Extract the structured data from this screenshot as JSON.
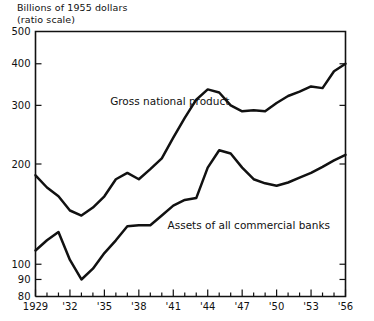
{
  "chart_data": {
    "type": "line",
    "title": "Billions of 1955 dollars",
    "subtitle": "(ratio scale)",
    "ylabel": "Billions of 1955 dollars (ratio scale)",
    "xlabel": "",
    "scale": "log",
    "grid": false,
    "legend_position": "inline-annotation",
    "ylim": [
      80,
      500
    ],
    "xlim": [
      1929,
      1956
    ],
    "ytick_labels": [
      "500",
      "400",
      "300",
      "200",
      "100",
      "90",
      "80"
    ],
    "ytick_values": [
      500,
      400,
      300,
      200,
      100,
      90,
      80
    ],
    "xtick_labels": [
      "1929",
      "'32",
      "'35",
      "'38",
      "'41",
      "'44",
      "'47",
      "'50",
      "'53",
      "'56"
    ],
    "xtick_values": [
      1929,
      1932,
      1935,
      1938,
      1941,
      1944,
      1947,
      1950,
      1953,
      1956
    ],
    "x": [
      1929,
      1930,
      1931,
      1932,
      1933,
      1934,
      1935,
      1936,
      1937,
      1938,
      1939,
      1940,
      1941,
      1942,
      1943,
      1944,
      1945,
      1946,
      1947,
      1948,
      1949,
      1950,
      1951,
      1952,
      1953,
      1954,
      1955,
      1956
    ],
    "series": [
      {
        "name": "Gross national product",
        "label": "Gross national product",
        "color": "#111111",
        "values": [
          185,
          170,
          160,
          145,
          140,
          148,
          160,
          180,
          188,
          180,
          193,
          208,
          240,
          275,
          312,
          335,
          328,
          300,
          288,
          290,
          288,
          305,
          320,
          330,
          342,
          338,
          380,
          400
        ]
      },
      {
        "name": "Assets of all commercial banks",
        "label": "Assets of all commercial banks",
        "color": "#111111",
        "values": [
          110,
          118,
          125,
          103,
          90,
          97,
          108,
          118,
          130,
          131,
          131,
          140,
          150,
          156,
          158,
          195,
          220,
          215,
          195,
          180,
          175,
          172,
          176,
          182,
          188,
          196,
          205,
          213
        ]
      }
    ],
    "annotations": [
      {
        "text": "Gross national product",
        "x": 1935.5,
        "y": 300
      },
      {
        "text": "Assets of all commercial banks",
        "x": 1940.5,
        "y": 128
      }
    ]
  },
  "axis_caption": {
    "line1": "Billions of 1955 dollars",
    "line2": "(ratio scale)"
  }
}
